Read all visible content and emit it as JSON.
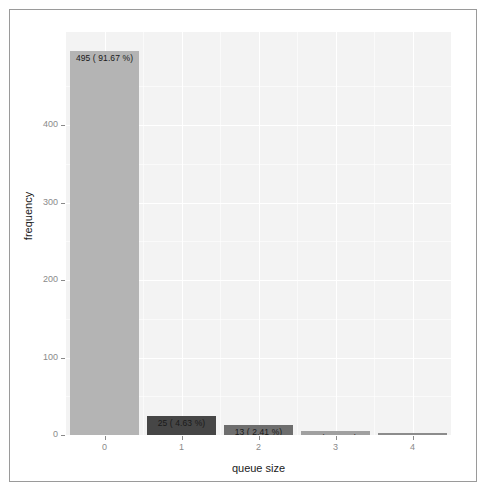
{
  "chart_data": {
    "type": "bar",
    "title": "",
    "subtitle": "",
    "xlabel": "queue size",
    "ylabel": "frequency",
    "categories": [
      "0",
      "1",
      "2",
      "3",
      "4"
    ],
    "values": [
      495,
      25,
      13,
      5,
      2
    ],
    "percentages": [
      91.67,
      4.63,
      2.41,
      0.93,
      0.37
    ],
    "data_labels": [
      "495 ( 91.67 %)",
      "25 ( 4.63 %)",
      "13 ( 2.41 %)",
      "5 ( 0.93 %)",
      "2 ( 0.37 %)"
    ],
    "bar_colors": [
      "#b4b4b4",
      "#464646",
      "#6e6e6e",
      "#a0a0a0",
      "#8c8c8c"
    ],
    "xlim": [
      -0.5,
      4.5
    ],
    "ylim": [
      0,
      520
    ],
    "x_tick_labels": [
      "0",
      "1",
      "2",
      "3",
      "4"
    ],
    "y_tick_labels": [
      "0",
      "100",
      "200",
      "300",
      "400"
    ],
    "y_tick_values": [
      0,
      100,
      200,
      300,
      400
    ],
    "grid": true,
    "legend": false,
    "panel_background": "#f3f3f3",
    "total": 540
  }
}
